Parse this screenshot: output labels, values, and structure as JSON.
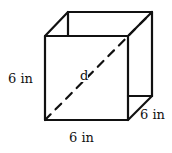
{
  "diagram": {
    "type": "cube",
    "labels": {
      "height": "6 in",
      "width": "6 in",
      "depth": "6 in",
      "diagonal": "d"
    }
  }
}
